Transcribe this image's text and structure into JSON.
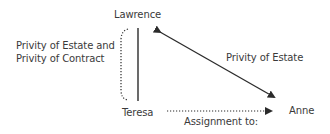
{
  "nodes": {
    "lawrence": "Lawrence",
    "teresa": "Teresa",
    "anne": "Anne"
  },
  "labels": {
    "left_line1": "Privity of Estate and",
    "left_line2": "Privity of Contract",
    "diagonal": "Privity of Estate",
    "assignment": "Assignment to:"
  },
  "colors": {
    "line": "#2b2b2b",
    "text": "#3a3a3a",
    "background": "#ffffff"
  }
}
